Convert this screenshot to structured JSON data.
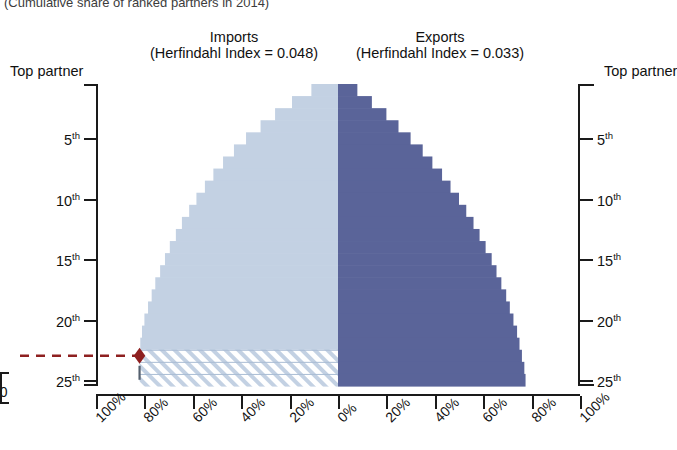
{
  "caption": "(Cumulative share of ranked partners in 2014)",
  "panels": {
    "imports": {
      "title": "Imports",
      "subtitle": "(Herfindahl Index = 0.048)",
      "herfindahl": 0.048,
      "color": "#c3d1e3"
    },
    "exports": {
      "title": "Exports",
      "subtitle": "(Herfindahl Index = 0.033)",
      "herfindahl": 0.033,
      "color": "#5a6499"
    }
  },
  "axes": {
    "y_left": {
      "header": "Top partner",
      "ticks": [
        "5",
        "10",
        "15",
        "20",
        "25"
      ],
      "suffix": "th"
    },
    "y_right": {
      "header": "Top partner",
      "ticks": [
        "5",
        "10",
        "15",
        "20",
        "25"
      ],
      "suffix": "th"
    },
    "x_labels": [
      "100%",
      "80%",
      "60%",
      "40%",
      "20%",
      "0%",
      "20%",
      "40%",
      "60%",
      "80%",
      "100%"
    ],
    "edge_fragment": "50"
  },
  "marker": {
    "name": "highlight-diamond",
    "color": "#8e2020",
    "rank": 23,
    "value_pct": 82
  },
  "chart_data": {
    "type": "bar",
    "orientation": "horizontal-diverging",
    "title": "(Cumulative share of ranked partners in 2014)",
    "xlabel": "",
    "ylabel": "Partner rank",
    "xlim": [
      -100,
      100
    ],
    "x_tick_labels": [
      "100%",
      "80%",
      "60%",
      "40%",
      "20%",
      "0%",
      "20%",
      "40%",
      "60%",
      "80%",
      "100%"
    ],
    "grid": false,
    "legend": "none",
    "categories": [
      "Top partner",
      "2nd",
      "3rd",
      "4th",
      "5th",
      "6th",
      "7th",
      "8th",
      "9th",
      "10th",
      "11th",
      "12th",
      "13th",
      "14th",
      "15th",
      "16th",
      "17th",
      "18th",
      "19th",
      "20th",
      "21st",
      "22nd",
      "23rd",
      "24th",
      "25th"
    ],
    "annotations": [
      {
        "text": "Imports (Herfindahl Index = 0.048)",
        "side": "left"
      },
      {
        "text": "Exports (Herfindahl Index = 0.033)",
        "side": "right"
      },
      {
        "text": "highlight at 23rd partner, 82%",
        "side": "left"
      }
    ],
    "series": [
      {
        "name": "Imports",
        "side": "left",
        "color": "#c3d1e3",
        "note": "cumulative share, plotted leftward from 0%",
        "values": [
          11,
          19,
          26,
          32,
          38,
          43,
          47.5,
          51.5,
          55,
          58.5,
          61.5,
          64.5,
          67,
          69.5,
          71.5,
          73.5,
          75.5,
          77,
          78.5,
          80,
          81,
          81.7,
          82,
          82,
          82
        ],
        "hatched_from_rank": 23
      },
      {
        "name": "Exports",
        "side": "right",
        "color": "#5a6499",
        "note": "cumulative share, plotted rightward from 0%",
        "values": [
          8,
          14,
          20,
          25,
          30,
          35,
          39,
          43,
          46.5,
          50,
          53,
          56,
          58.5,
          61,
          63.5,
          65.5,
          67.5,
          69.5,
          71,
          72.5,
          74,
          75,
          76,
          77,
          77.5
        ]
      }
    ]
  }
}
